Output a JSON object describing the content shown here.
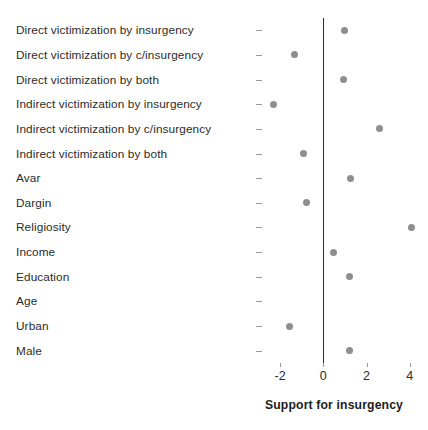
{
  "chart_data": {
    "type": "scatter",
    "title": "",
    "xlabel": "Support for insurgency",
    "ylabel": "",
    "xlim": [
      -2.75,
      4.85
    ],
    "ylim": [
      0,
      15
    ],
    "grid": false,
    "legend": null,
    "zero_reference_line": 0,
    "xticks": [
      -2,
      0,
      2,
      4
    ],
    "xticklabels": [
      "-2",
      "0",
      "2",
      "4"
    ],
    "categories": [
      "Direct victimization by insurgency",
      "Direct victimization by c/insurgency",
      "Direct victimization by both",
      "Indirect victimization by insurgency",
      "Indirect victimization by c/insurgency",
      "Indirect victimization by both",
      "Avar",
      "Dargin",
      "Religiosity",
      "Income",
      "Education",
      "Age",
      "Urban",
      "Male"
    ],
    "values": [
      1.0,
      -1.35,
      0.95,
      -2.3,
      2.6,
      -0.9,
      1.25,
      -0.8,
      4.1,
      0.45,
      1.2,
      -3.1,
      -1.55,
      1.2
    ],
    "point_color": "#8e8e8e",
    "zero_line_color": "#2d2d2d",
    "text_color": "#2b2b2b"
  }
}
